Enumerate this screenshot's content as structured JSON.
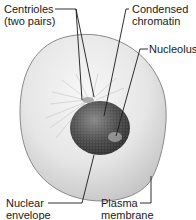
{
  "diagram": {
    "labels": {
      "centrioles": {
        "line1": "Centrioles",
        "line2": "(two pairs)"
      },
      "condensed_chromatin": {
        "line1": "Condensed",
        "line2": "chromatin"
      },
      "nucleolus": {
        "line1": "Nucleolus"
      },
      "nuclear_envelope": {
        "line1": "Nuclear",
        "line2": "envelope"
      },
      "plasma_membrane": {
        "line1": "Plasma",
        "line2": "membrane"
      }
    },
    "colors": {
      "cell_fill_light": "#f2f2f2",
      "cell_fill_mid": "#d9d9d9",
      "cell_edge": "#8a8a8a",
      "nucleus_dark": "#3a3a3a",
      "nucleus_mid": "#6e6e6e",
      "leader_line": "#1a1a1a",
      "text": "#1a1a1a"
    }
  }
}
